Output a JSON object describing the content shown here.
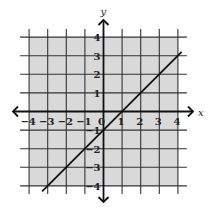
{
  "chart_data": {
    "type": "line",
    "title": "",
    "xlabel": "x",
    "ylabel": "y",
    "xlim": [
      -4,
      4
    ],
    "ylim": [
      -4,
      4
    ],
    "grid": true,
    "shaded_region": true,
    "x_ticks": [
      "-4",
      "-3",
      "-2",
      "-1",
      "0",
      "1",
      "2",
      "3",
      "4"
    ],
    "y_ticks": [
      "4",
      "3",
      "2",
      "1",
      "-1",
      "-2",
      "-3",
      "-4"
    ],
    "series": [
      {
        "name": "y = x - 1",
        "x": [
          -3.3,
          4.2
        ],
        "y": [
          -4.3,
          3.2
        ]
      }
    ]
  },
  "colors": {
    "shading": "#d9d9d9",
    "grid": "#333333",
    "axis": "#111111",
    "line": "#111111"
  },
  "labels": {
    "x_axis": "x",
    "y_axis": "y",
    "origin": "0"
  }
}
